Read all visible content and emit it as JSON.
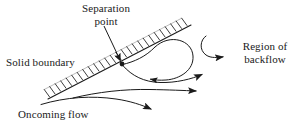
{
  "figure": {
    "background_color": "#ffffff",
    "ink_color": "#1a1a1a",
    "width": 299,
    "height": 128
  },
  "labels": {
    "separation_point": "Separation\npoint",
    "solid_boundary": "Solid boundary",
    "region_of_backflow": "Region of\nbackflow",
    "oncoming_flow": "Oncoming flow"
  },
  "diagram_data": {
    "type": "diagram",
    "subject": "flow separation over an inclined solid boundary",
    "boundary": {
      "name": "solid-boundary-wall",
      "start": [
        48,
        99
      ],
      "end": [
        191,
        25
      ],
      "hatching": "cross-hatch ticks on upper side",
      "hatch_count": 26
    },
    "separation_point": {
      "name": "separation-point",
      "position": [
        122,
        64
      ],
      "marker": "filled dot"
    },
    "pointer_arrow": {
      "name": "separation-point-pointer",
      "from": [
        104,
        26
      ],
      "to": [
        121,
        61
      ]
    },
    "streamlines": [
      {
        "name": "dividing-streamline-upper",
        "description": "leaves separation point and curves up-right into recirculation loop",
        "arrow": false
      },
      {
        "name": "recirculation-loop",
        "description": "closed-looking loop in the backflow region with arrow pointing right",
        "arrow": true
      },
      {
        "name": "backflow-hook-arrow",
        "description": "small hooked curve above loop pointing right toward label",
        "arrow": true
      },
      {
        "name": "streamline-mid",
        "description": "streamline from separation point sweeping right with arrow",
        "arrow": true
      },
      {
        "name": "streamline-lower",
        "description": "long streamline across lower field with arrow",
        "arrow": true
      },
      {
        "name": "streamline-oncoming",
        "description": "oncoming flow streamline low and left with arrow",
        "arrow": true
      }
    ],
    "arrow_count": 5
  }
}
